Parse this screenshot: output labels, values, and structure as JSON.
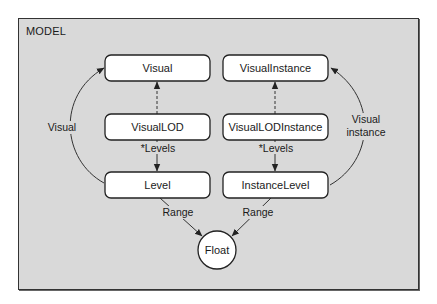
{
  "frame": {
    "title": "MODEL",
    "background": "#d9d9d9",
    "border": "#333333"
  },
  "nodes": {
    "visual": {
      "label": "Visual",
      "shape": "rounded-rect"
    },
    "visual_instance": {
      "label": "VisualInstance",
      "shape": "rounded-rect"
    },
    "visual_lod": {
      "label": "VisualLOD",
      "shape": "rounded-rect"
    },
    "visual_lod_instance": {
      "label": "VisualLODInstance",
      "shape": "rounded-rect"
    },
    "level": {
      "label": "Level",
      "shape": "rounded-rect"
    },
    "instance_level": {
      "label": "InstanceLevel",
      "shape": "rounded-rect"
    },
    "float": {
      "label": "Float",
      "shape": "circle"
    }
  },
  "edges": {
    "level_to_visual": {
      "label": "Visual",
      "style": "solid",
      "from": "Level",
      "to": "Visual"
    },
    "instance_level_to_visual_instance": {
      "label_line1": "Visual",
      "label_line2": "instance",
      "style": "solid",
      "from": "InstanceLevel",
      "to": "VisualInstance"
    },
    "visual_lod_to_visual": {
      "label": "",
      "style": "dashed",
      "from": "VisualLOD",
      "to": "Visual"
    },
    "visual_lod_instance_to_visual_instance": {
      "label": "",
      "style": "dashed",
      "from": "VisualLODInstance",
      "to": "VisualInstance"
    },
    "visual_lod_to_level": {
      "label": "*Levels",
      "style": "solid",
      "from": "VisualLOD",
      "to": "Level"
    },
    "visual_lod_instance_to_instance_level": {
      "label": "*Levels",
      "style": "solid",
      "from": "VisualLODInstance",
      "to": "InstanceLevel"
    },
    "level_to_float": {
      "label": "Range",
      "style": "solid",
      "from": "Level",
      "to": "Float"
    },
    "instance_level_to_float": {
      "label": "Range",
      "style": "solid",
      "from": "InstanceLevel",
      "to": "Float"
    }
  }
}
